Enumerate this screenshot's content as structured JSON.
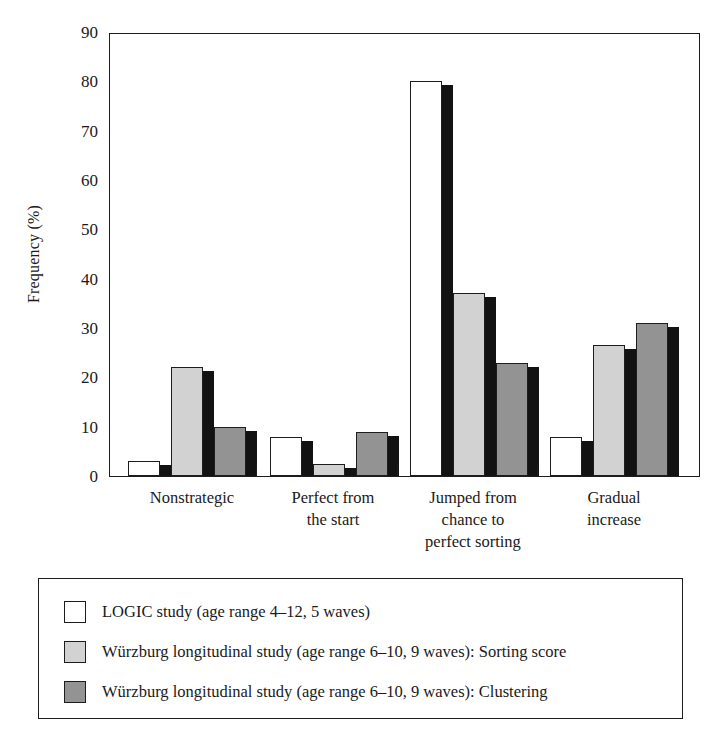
{
  "chart_data": {
    "type": "bar",
    "title": "",
    "xlabel": "",
    "ylabel": "Frequency (%)",
    "ylim": [
      0,
      90
    ],
    "yticks": [
      0,
      10,
      20,
      30,
      40,
      50,
      60,
      70,
      80,
      90
    ],
    "grid": false,
    "legend_position": "below-plot",
    "categories": [
      "Nonstrategic",
      "Perfect from\nthe start",
      "Jumped from\nchance to\nperfect sorting",
      "Gradual\nincrease"
    ],
    "category_lines": [
      [
        "Nonstrategic"
      ],
      [
        "Perfect from",
        "the start"
      ],
      [
        "Jumped from",
        "chance to",
        "perfect sorting"
      ],
      [
        "Gradual",
        "increase"
      ]
    ],
    "series": [
      {
        "name": "LOGIC study (age range 4–12, 5 waves)",
        "key": "logic",
        "color": "#ffffff",
        "values": [
          3,
          8,
          80,
          8
        ]
      },
      {
        "name": "Würzburg longitudinal study (age range 6–10, 9 waves): Sorting score",
        "key": "sorting",
        "color": "#d2d2d2",
        "values": [
          22,
          2.5,
          37,
          26.5
        ]
      },
      {
        "name": "Würzburg longitudinal study (age range 6–10, 9 waves): Clustering",
        "key": "clustering",
        "color": "#939393",
        "values": [
          10,
          9,
          23,
          31
        ]
      }
    ]
  },
  "axes": {
    "y_title": "Frequency (%)",
    "y_tick_labels": [
      "0",
      "10",
      "20",
      "30",
      "40",
      "50",
      "60",
      "70",
      "80",
      "90"
    ]
  },
  "legend": {
    "entries": [
      {
        "swatch": "#ffffff",
        "label": "LOGIC study (age range 4–12, 5 waves)"
      },
      {
        "swatch": "#d2d2d2",
        "label": "Würzburg longitudinal study (age range 6–10, 9 waves): Sorting score"
      },
      {
        "swatch": "#939393",
        "label": "Würzburg longitudinal study (age range 6–10, 9 waves): Clustering"
      }
    ]
  },
  "colors": {
    "axis": "#1d1d1d",
    "shadow": "#121212",
    "series_logic": "#ffffff",
    "series_sorting": "#d2d2d2",
    "series_clustering": "#939393",
    "background": "#ffffff"
  }
}
